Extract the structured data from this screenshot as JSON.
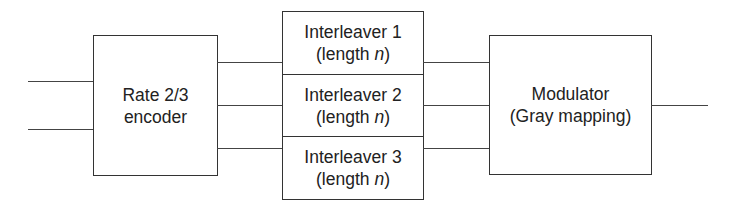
{
  "diagram": {
    "type": "block-diagram",
    "colors": {
      "line": "#444444",
      "border": "#333333",
      "text": "#222222",
      "background": "#ffffff"
    },
    "encoder": {
      "line1": "Rate 2/3",
      "line2": "encoder"
    },
    "interleavers": [
      {
        "title": "Interleaver 1",
        "length_prefix": "(length ",
        "length_var": "n",
        "length_suffix": ")"
      },
      {
        "title": "Interleaver 2",
        "length_prefix": "(length ",
        "length_var": "n",
        "length_suffix": ")"
      },
      {
        "title": "Interleaver 3",
        "length_prefix": "(length ",
        "length_var": "n",
        "length_suffix": ")"
      }
    ],
    "modulator": {
      "line1": "Modulator",
      "line2": "(Gray mapping)"
    },
    "connections": [
      {
        "from": "input-1",
        "to": "encoder"
      },
      {
        "from": "input-2",
        "to": "encoder"
      },
      {
        "from": "encoder",
        "to": "interleaver-1"
      },
      {
        "from": "encoder",
        "to": "interleaver-2"
      },
      {
        "from": "encoder",
        "to": "interleaver-3"
      },
      {
        "from": "interleaver-1",
        "to": "modulator"
      },
      {
        "from": "interleaver-2",
        "to": "modulator"
      },
      {
        "from": "interleaver-3",
        "to": "modulator"
      },
      {
        "from": "modulator",
        "to": "output"
      }
    ]
  }
}
